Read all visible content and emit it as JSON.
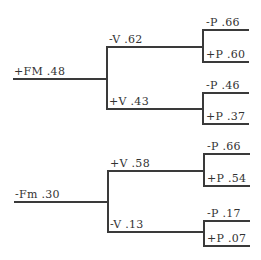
{
  "diagram": {
    "type": "tree",
    "orientation": "left-to-right",
    "line_color": "#3a3a3a",
    "text_color": "#333333",
    "trees": [
      {
        "root": {
          "label": "+FM .48"
        },
        "branches": [
          {
            "label": "-V .62",
            "leaves": [
              {
                "label": "-P .66"
              },
              {
                "label": "+P .60"
              }
            ]
          },
          {
            "label": "+V .43",
            "leaves": [
              {
                "label": "-P .46"
              },
              {
                "label": "+P .37"
              }
            ]
          }
        ]
      },
      {
        "root": {
          "label": "-Fm .30"
        },
        "branches": [
          {
            "label": "+V .58",
            "leaves": [
              {
                "label": "-P .66"
              },
              {
                "label": "+P .54"
              }
            ]
          },
          {
            "label": "-V .13",
            "leaves": [
              {
                "label": "-P .17"
              },
              {
                "label": "+P .07"
              }
            ]
          }
        ]
      }
    ]
  }
}
